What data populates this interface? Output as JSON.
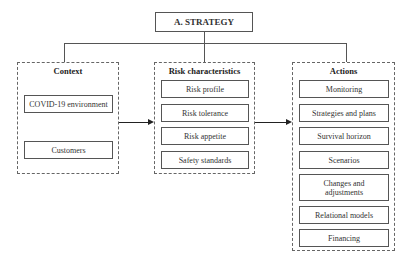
{
  "diagram": {
    "root": {
      "label": "A. STRATEGY"
    },
    "groups": [
      {
        "title": "Context",
        "items": [
          "COVID-19 environment",
          "Customers"
        ]
      },
      {
        "title": "Risk characteristics",
        "items": [
          "Risk profile",
          "Risk tolerance",
          "Risk appetite",
          "Safety standards"
        ]
      },
      {
        "title": "Actions",
        "items": [
          "Monitoring",
          "Strategies and plans",
          "Survival horizon",
          "Scenarios",
          "Changes and adjustments",
          "Relational models",
          "Financing"
        ]
      }
    ],
    "connections": [
      {
        "from": "A. STRATEGY",
        "to": "Context",
        "type": "tree-line"
      },
      {
        "from": "A. STRATEGY",
        "to": "Risk characteristics",
        "type": "tree-line"
      },
      {
        "from": "A. STRATEGY",
        "to": "Actions",
        "type": "tree-line"
      },
      {
        "from": "Context",
        "to": "Risk characteristics",
        "type": "arrow"
      },
      {
        "from": "Risk characteristics",
        "to": "Actions",
        "type": "arrow"
      }
    ]
  }
}
